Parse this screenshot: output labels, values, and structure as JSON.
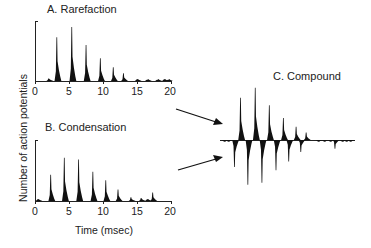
{
  "figure": {
    "ylabel": "Number of action potentials",
    "xlabel": "Time (msec)"
  },
  "panels": {
    "a": {
      "title": "A. Rarefaction"
    },
    "b": {
      "title": "B. Condensation"
    },
    "c": {
      "title": "C. Compound"
    }
  },
  "ticks": [
    "0",
    "5",
    "10",
    "15",
    "20"
  ],
  "colors": {
    "ink": "#111111",
    "background": "#ffffff"
  },
  "chart_data": [
    {
      "type": "bar",
      "title": "A. Rarefaction",
      "xlabel": "Time (msec)",
      "ylabel": "Number of action potentials",
      "xlim": [
        0,
        20
      ],
      "xticks": [
        0,
        5,
        10,
        15,
        20
      ],
      "grid": false,
      "description": "Post-stimulus time histogram; relative peak heights (0-1 of axis height)",
      "x": [
        2.0,
        3.2,
        5.4,
        7.5,
        9.6,
        11.5,
        13.0,
        15.0,
        16.5,
        18.0,
        19.0,
        19.6
      ],
      "values": [
        0.04,
        0.73,
        0.9,
        0.6,
        0.38,
        0.23,
        0.13,
        0.03,
        0.02,
        0.02,
        0.03,
        0.02
      ]
    },
    {
      "type": "bar",
      "title": "B. Condensation",
      "xlabel": "Time (msec)",
      "ylabel": "Number of action potentials",
      "xlim": [
        0,
        20
      ],
      "xticks": [
        0,
        5,
        10,
        15,
        20
      ],
      "grid": false,
      "description": "Post-stimulus time histogram; relative peak heights (0-1 of axis height)",
      "x": [
        0.4,
        2.3,
        4.3,
        6.4,
        8.5,
        10.4,
        12.2,
        14.1,
        15.6,
        16.5,
        17.3
      ],
      "values": [
        0.03,
        0.43,
        0.71,
        0.68,
        0.48,
        0.34,
        0.19,
        0.06,
        0.05,
        0.03,
        0.14
      ]
    },
    {
      "type": "bar",
      "title": "C. Compound",
      "description": "Rarefaction histogram plotted upward, condensation histogram plotted downward on a shared baseline; relative amplitudes",
      "series": [
        {
          "name": "Rarefaction (up)",
          "x": [
            3.2,
            5.4,
            7.5,
            9.6,
            11.5,
            13.0
          ],
          "values": [
            0.73,
            0.9,
            0.6,
            0.38,
            0.23,
            0.13
          ]
        },
        {
          "name": "Condensation (down)",
          "x": [
            2.3,
            4.3,
            6.4,
            8.5,
            10.4,
            12.2,
            17.3
          ],
          "values": [
            -0.43,
            -0.71,
            -0.68,
            -0.48,
            -0.34,
            -0.19,
            -0.14
          ]
        }
      ]
    }
  ]
}
